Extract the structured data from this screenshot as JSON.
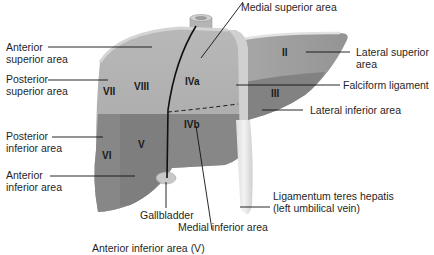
{
  "figure": {
    "colors": {
      "upper_surface": "#a6a6a6",
      "upper_highlight": "#bdbdbd",
      "lower_surface": "#858585",
      "lower_right_dark": "#7a7a7a",
      "lateral_superior": "#9b9b9b",
      "lateral_inferior": "#808080",
      "falciform": "#d2d2d2",
      "ligamentum": "#e4e4e4",
      "gallbladder": "#c9c9c9",
      "ivc": "#b4b4b4",
      "lines": "#111111"
    }
  },
  "segments": {
    "VII": "VII",
    "VIII": "VIII",
    "IVa": "IVa",
    "IVb": "IVb",
    "V": "V",
    "VI": "VI",
    "II": "II",
    "III": "III"
  },
  "labels": {
    "medial_superior": "Medial superior area",
    "anterior_superior_1": "Anterior",
    "anterior_superior_2": "superior area",
    "posterior_superior_1": "Posterior",
    "posterior_superior_2": "superior area",
    "lateral_superior_1": "Lateral superior",
    "lateral_superior_2": "area",
    "falciform": "Falciform ligament",
    "lateral_inferior": "Lateral inferior area",
    "posterior_inferior_1": "Posterior",
    "posterior_inferior_2": "inferior area",
    "anterior_inferior_1": "Anterior",
    "anterior_inferior_2": "inferior area",
    "gallbladder": "Gallbladder",
    "medial_inferior": "Medial inferior area",
    "ligamentum_1": "Ligamentum teres hepatis",
    "ligamentum_2": "(left umbilical vein)",
    "caption_partial": "Anterior inferior area (V)"
  }
}
